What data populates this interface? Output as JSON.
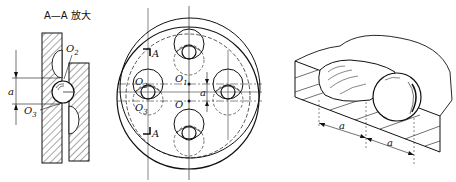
{
  "left_view": {
    "title": "A—A 放大",
    "labels": {
      "o2": "O",
      "o2_sub": "2",
      "o3": "O",
      "o3_sub": "3",
      "dim": "a"
    }
  },
  "center_view": {
    "labels": {
      "section_top": "A",
      "section_bottom": "A",
      "o1": "O",
      "o1_sub": "1",
      "o2": "O",
      "o2_sub": "2",
      "o3": "O",
      "o3_sub": "3",
      "o": "O",
      "dim": "a"
    }
  },
  "right_view": {
    "labels": {
      "dim1": "a",
      "dim2": "a"
    }
  }
}
